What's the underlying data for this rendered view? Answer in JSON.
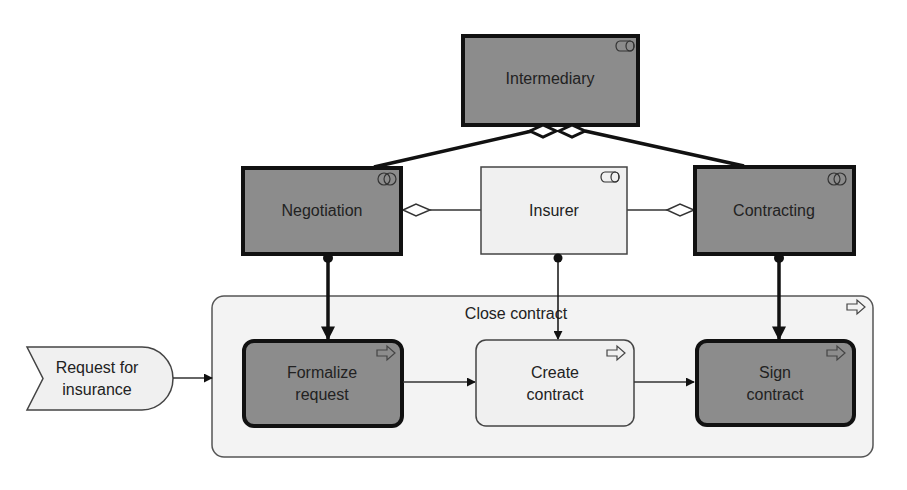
{
  "diagram": {
    "notation": "ArchiMate business layer",
    "colors": {
      "dark_fill": "#8c8c8c",
      "light_fill": "#f0f0f0",
      "container_fill": "#f3f3f3",
      "stroke": "#111111",
      "text": "#222222"
    },
    "nodes": {
      "intermediary": {
        "label": "Intermediary",
        "type": "business-role",
        "icon": "role-icon"
      },
      "negotiation": {
        "label": "Negotiation",
        "type": "business-collaboration",
        "icon": "collaboration-icon"
      },
      "insurer": {
        "label": "Insurer",
        "type": "business-role",
        "icon": "role-icon"
      },
      "contracting": {
        "label": "Contracting",
        "type": "business-collaboration",
        "icon": "collaboration-icon"
      },
      "close_contract": {
        "label": "Close contract",
        "type": "business-process",
        "icon": "process-arrow-icon"
      },
      "request_for_insurance": {
        "label_line1": "Request for",
        "label_line2": "insurance",
        "type": "business-event"
      },
      "formalize_request": {
        "label_line1": "Formalize",
        "label_line2": "request",
        "type": "business-process",
        "icon": "process-arrow-icon"
      },
      "create_contract": {
        "label_line1": "Create",
        "label_line2": "contract",
        "type": "business-process",
        "icon": "process-arrow-icon"
      },
      "sign_contract": {
        "label_line1": "Sign",
        "label_line2": "contract",
        "type": "business-process",
        "icon": "process-arrow-icon"
      }
    },
    "edges": [
      {
        "from": "intermediary",
        "to": "negotiation",
        "type": "aggregation"
      },
      {
        "from": "intermediary",
        "to": "contracting",
        "type": "aggregation"
      },
      {
        "from": "negotiation",
        "to": "insurer",
        "type": "aggregation"
      },
      {
        "from": "contracting",
        "to": "insurer",
        "type": "aggregation"
      },
      {
        "from": "negotiation",
        "to": "formalize_request",
        "type": "assignment"
      },
      {
        "from": "insurer",
        "to": "create_contract",
        "type": "assignment"
      },
      {
        "from": "contracting",
        "to": "sign_contract",
        "type": "assignment"
      },
      {
        "from": "request_for_insurance",
        "to": "close_contract",
        "type": "triggering"
      },
      {
        "from": "formalize_request",
        "to": "create_contract",
        "type": "triggering"
      },
      {
        "from": "create_contract",
        "to": "sign_contract",
        "type": "triggering"
      }
    ]
  }
}
